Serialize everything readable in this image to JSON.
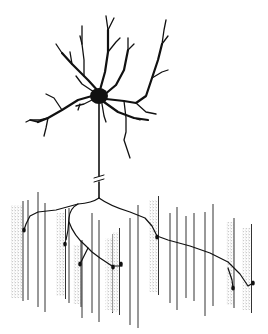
{
  "figure": {
    "colors": {
      "ink": "#111111",
      "fiber_stipple": "#9a9a9a",
      "background": "#ffffff"
    },
    "soma": {
      "cx": 99,
      "cy": 96,
      "rx": 9,
      "ry": 8
    },
    "axon": {
      "x": 99,
      "y_top": 104,
      "y_branch": 198,
      "break_y": 178
    },
    "muscle_fibers_shaded": [
      {
        "x": 17,
        "y1": 205,
        "y2": 298,
        "w": 12
      },
      {
        "x": 61,
        "y1": 213,
        "y2": 296,
        "w": 9
      },
      {
        "x": 77,
        "y1": 245,
        "y2": 304,
        "w": 8
      },
      {
        "x": 109,
        "y1": 238,
        "y2": 310,
        "w": 7
      },
      {
        "x": 116,
        "y1": 232,
        "y2": 312,
        "w": 7
      },
      {
        "x": 154,
        "y1": 200,
        "y2": 292,
        "w": 9
      },
      {
        "x": 230,
        "y1": 222,
        "y2": 305,
        "w": 8
      },
      {
        "x": 247,
        "y1": 228,
        "y2": 310,
        "w": 9
      }
    ],
    "muscle_fibers_plain": [
      {
        "x": 28,
        "y1": 200,
        "y2": 300
      },
      {
        "x": 38,
        "y1": 192,
        "y2": 307
      },
      {
        "x": 45,
        "y1": 203,
        "y2": 312
      },
      {
        "x": 69,
        "y1": 208,
        "y2": 303
      },
      {
        "x": 82,
        "y1": 240,
        "y2": 318
      },
      {
        "x": 92,
        "y1": 213,
        "y2": 313
      },
      {
        "x": 99,
        "y1": 220,
        "y2": 322
      },
      {
        "x": 130,
        "y1": 218,
        "y2": 325
      },
      {
        "x": 138,
        "y1": 205,
        "y2": 328
      },
      {
        "x": 170,
        "y1": 213,
        "y2": 303
      },
      {
        "x": 177,
        "y1": 207,
        "y2": 310
      },
      {
        "x": 186,
        "y1": 216,
        "y2": 298
      },
      {
        "x": 194,
        "y1": 213,
        "y2": 301
      },
      {
        "x": 205,
        "y1": 212,
        "y2": 316
      },
      {
        "x": 213,
        "y1": 204,
        "y2": 306
      }
    ],
    "end_plates": [
      {
        "cx": 24,
        "cy": 230
      },
      {
        "cx": 65,
        "cy": 244
      },
      {
        "cx": 80,
        "cy": 264
      },
      {
        "cx": 113,
        "cy": 267
      },
      {
        "cx": 121,
        "cy": 264
      },
      {
        "cx": 157,
        "cy": 237
      },
      {
        "cx": 233,
        "cy": 288
      },
      {
        "cx": 253,
        "cy": 283
      }
    ]
  }
}
